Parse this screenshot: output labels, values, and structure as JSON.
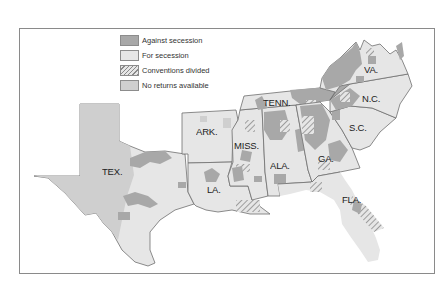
{
  "legend": {
    "items": [
      {
        "label": "Against secession",
        "color": "#a8a8a8",
        "pattern": "solid"
      },
      {
        "label": "For secession",
        "color": "#e6e6e6",
        "pattern": "solid"
      },
      {
        "label": "Conventions divided",
        "color": "#e6e6e6",
        "pattern": "hatch"
      },
      {
        "label": "No returns available",
        "color": "#cfcfcf",
        "pattern": "solid"
      }
    ]
  },
  "states": [
    {
      "abbr": "TEX.",
      "x": 102,
      "y": 172
    },
    {
      "abbr": "ARK.",
      "x": 197,
      "y": 132
    },
    {
      "abbr": "LA.",
      "x": 208,
      "y": 188
    },
    {
      "abbr": "MISS.",
      "x": 235,
      "y": 143
    },
    {
      "abbr": "ALA.",
      "x": 270,
      "y": 164
    },
    {
      "abbr": "TENN.",
      "x": 264,
      "y": 100
    },
    {
      "abbr": "GA.",
      "x": 318,
      "y": 157
    },
    {
      "abbr": "FLA.",
      "x": 343,
      "y": 197
    },
    {
      "abbr": "S.C.",
      "x": 350,
      "y": 126
    },
    {
      "abbr": "N.C.",
      "x": 362,
      "y": 96
    },
    {
      "abbr": "VA.",
      "x": 365,
      "y": 66
    }
  ],
  "colors": {
    "against": "#a8a8a8",
    "for": "#e6e6e6",
    "no_returns": "#cfcfcf",
    "border": "#6f6f6f",
    "frame": "#8a8a8a"
  }
}
